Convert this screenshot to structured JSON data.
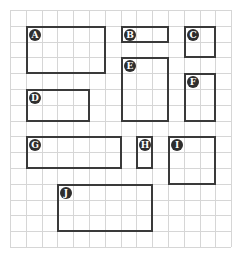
{
  "grid": {
    "origin_x": 10,
    "origin_y": 10,
    "cell": 15.8,
    "cols": 14,
    "rows": 15,
    "line_color": "#d6d6d6"
  },
  "rect_border_color": "#3a3a3a",
  "badge_color": "#2e2e2e",
  "rectangles": [
    {
      "label": "A",
      "col": 1,
      "row": 1,
      "w": 5,
      "h": 3
    },
    {
      "label": "B",
      "col": 7,
      "row": 1,
      "w": 3,
      "h": 1
    },
    {
      "label": "C",
      "col": 11,
      "row": 1,
      "w": 2,
      "h": 2
    },
    {
      "label": "D",
      "col": 1,
      "row": 5,
      "w": 4,
      "h": 2
    },
    {
      "label": "E",
      "col": 7,
      "row": 3,
      "w": 3,
      "h": 4
    },
    {
      "label": "F",
      "col": 11,
      "row": 4,
      "w": 2,
      "h": 3
    },
    {
      "label": "G",
      "col": 1,
      "row": 8,
      "w": 6,
      "h": 2
    },
    {
      "label": "H",
      "col": 8,
      "row": 8,
      "w": 1,
      "h": 2
    },
    {
      "label": "I",
      "col": 10,
      "row": 8,
      "w": 3,
      "h": 3
    },
    {
      "label": "J",
      "col": 3,
      "row": 11,
      "w": 6,
      "h": 3
    }
  ]
}
